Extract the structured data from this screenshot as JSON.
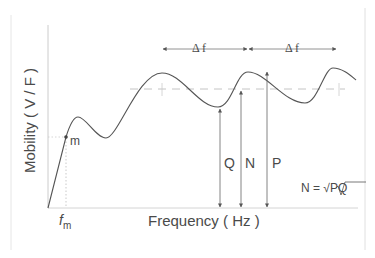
{
  "figure": {
    "type": "mobility-frequency-response-diagram",
    "axes": {
      "ylabel": "Mobility ( V / F )",
      "xlabel": "Frequency ( Hz )"
    },
    "annotations": {
      "mass_point_label": "m",
      "mass_frequency_label": "f",
      "mass_frequency_subscript": "m",
      "delta_f_1": "Δ f",
      "delta_f_2": "Δ f",
      "q_label": "Q",
      "n_label": "N",
      "p_label": "P",
      "formula": "N = √PQ"
    },
    "colors": {
      "curve": "#555555",
      "axis": "#cccccc",
      "text": "#4a4a4a",
      "dashed": "#bbbbbb"
    }
  }
}
